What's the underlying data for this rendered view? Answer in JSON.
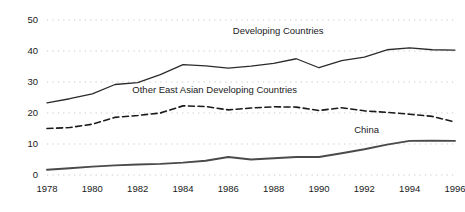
{
  "chart_data": {
    "type": "line",
    "title": "",
    "subtitle": "",
    "xlabel": "",
    "ylabel": "",
    "xlim": [
      1978,
      1996
    ],
    "ylim": [
      0,
      50
    ],
    "grid": true,
    "grid_style": "dotted-horizontal",
    "legend_position": "inline-annotations",
    "x": [
      1978,
      1979,
      1980,
      1981,
      1982,
      1983,
      1984,
      1985,
      1986,
      1987,
      1988,
      1989,
      1990,
      1991,
      1992,
      1993,
      1994,
      1995,
      1996
    ],
    "xticks": [
      1978,
      1980,
      1982,
      1984,
      1986,
      1988,
      1990,
      1992,
      1994,
      1996
    ],
    "xtick_labels": [
      "1978",
      "1980",
      "1982",
      "1984",
      "1986",
      "1988",
      "1990",
      "1992",
      "1994",
      "1996"
    ],
    "yticks": [
      0,
      10,
      20,
      30,
      40,
      50
    ],
    "ytick_labels": [
      "0",
      "10",
      "20",
      "30",
      "40",
      "50"
    ],
    "series": [
      {
        "name": "Developing Countries",
        "style": "solid",
        "color": "#2b2b2b",
        "width": 1.3,
        "label_x": 1988.2,
        "label_y": 45.4,
        "values": [
          23.3,
          24.6,
          26.2,
          29.2,
          29.8,
          32.4,
          35.6,
          35.2,
          34.5,
          35.1,
          36.0,
          37.5,
          34.6,
          36.9,
          38.0,
          40.4,
          41.0,
          40.4,
          40.3
        ]
      },
      {
        "name": "Other East Asian Developing Countries",
        "style": "dashed",
        "color": "#1a1a1a",
        "width": 1.6,
        "label_x": 1985.4,
        "label_y": 26.5,
        "values": [
          15.0,
          15.3,
          16.4,
          18.6,
          19.2,
          20.0,
          22.3,
          22.1,
          21.0,
          21.6,
          22.0,
          21.9,
          20.8,
          21.7,
          20.7,
          20.2,
          19.6,
          18.9,
          17.1
        ]
      },
      {
        "name": "China",
        "style": "solid",
        "color": "#4a4a4a",
        "width": 1.9,
        "label_x": 1992.1,
        "label_y": 13.6,
        "values": [
          1.7,
          2.2,
          2.7,
          3.1,
          3.4,
          3.6,
          4.0,
          4.6,
          5.8,
          5.0,
          5.4,
          5.8,
          5.8,
          7.0,
          8.3,
          9.8,
          11.0,
          11.1,
          11.0
        ]
      }
    ]
  },
  "axes": {
    "y_axis_name": "percent-axis",
    "x_axis_name": "year-axis"
  }
}
